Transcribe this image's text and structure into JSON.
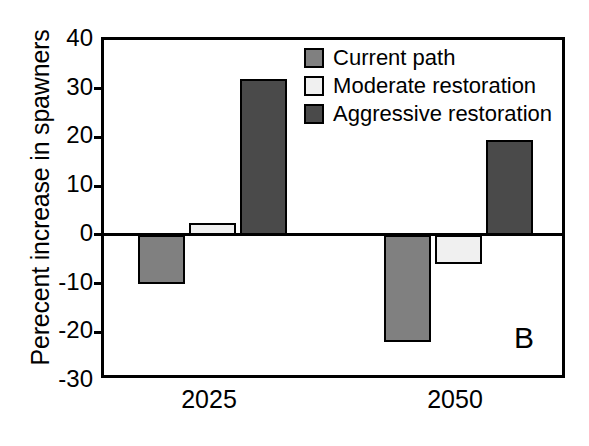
{
  "chart_data": {
    "type": "bar",
    "title": "",
    "panel_label": "B",
    "xlabel": "",
    "ylabel": "Perecent increase in spawners",
    "categories": [
      "2025",
      "2050"
    ],
    "ylim": [
      -30,
      40
    ],
    "yticks": [
      40,
      30,
      20,
      10,
      0,
      -10,
      -20,
      -30
    ],
    "ytick_labels": [
      "40",
      "30",
      "20",
      "10",
      "0",
      "-10",
      "-20",
      "-30"
    ],
    "grid": false,
    "legend_position": "top-right-inside",
    "series": [
      {
        "name": "Current path",
        "color": "#808080",
        "values": [
          -10,
          -22
        ]
      },
      {
        "name": "Moderate restoration",
        "color": "#f0f0f0",
        "values": [
          2.5,
          -6
        ]
      },
      {
        "name": "Aggressive restoration",
        "color": "#4a4a4a",
        "values": [
          32,
          19.5
        ]
      }
    ]
  }
}
